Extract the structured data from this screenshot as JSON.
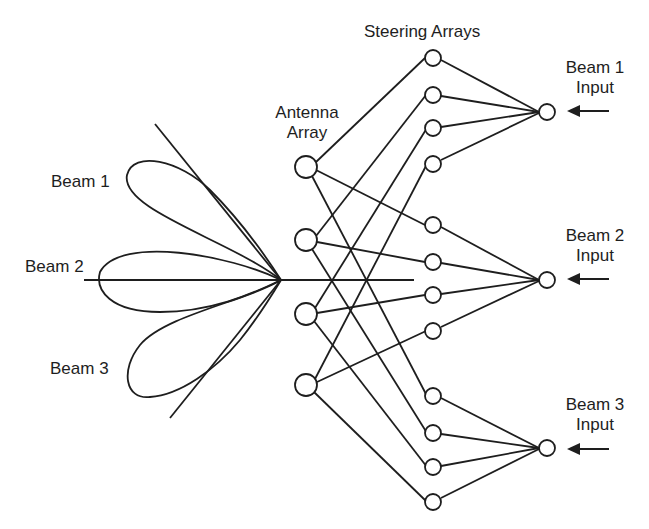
{
  "labels": {
    "steering_arrays": "Steering Arrays",
    "antenna_array_line1": "Antenna",
    "antenna_array_line2": "Array",
    "beam1": "Beam 1",
    "beam2": "Beam 2",
    "beam3": "Beam 3",
    "beam1_input_line1": "Beam 1",
    "beam1_input_line2": "Input",
    "beam2_input_line1": "Beam 2",
    "beam2_input_line2": "Input",
    "beam3_input_line1": "Beam 3",
    "beam3_input_line2": "Input"
  },
  "diagram": {
    "stroke_color": "#1e1e1e",
    "apex": [
      281,
      280
    ],
    "antenna_nodes": [
      [
        306,
        167
      ],
      [
        306,
        240
      ],
      [
        306,
        314
      ],
      [
        306,
        385
      ]
    ],
    "steering_nodes": [
      [
        433,
        58
      ],
      [
        433,
        95
      ],
      [
        433,
        128
      ],
      [
        433,
        164
      ],
      [
        433,
        225
      ],
      [
        433,
        262
      ],
      [
        433,
        295
      ],
      [
        433,
        331
      ],
      [
        433,
        396
      ],
      [
        433,
        433
      ],
      [
        433,
        467
      ],
      [
        433,
        502
      ]
    ],
    "input_nodes": [
      [
        547,
        112
      ],
      [
        547,
        280
      ],
      [
        547,
        448
      ]
    ]
  }
}
